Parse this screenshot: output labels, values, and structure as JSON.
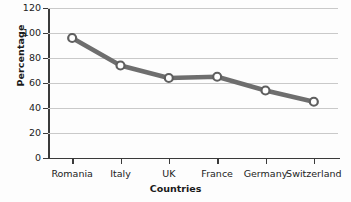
{
  "chart_data": {
    "type": "line",
    "title": "",
    "xlabel": "Countries",
    "ylabel": "Percentage",
    "categories": [
      "Romania",
      "Italy",
      "UK",
      "France",
      "Germany",
      "Switzerland"
    ],
    "values": [
      96,
      74,
      64,
      65,
      54,
      45
    ],
    "series": [
      {
        "name": "Percentage",
        "values": [
          96,
          74,
          64,
          65,
          54,
          45
        ]
      }
    ],
    "ylim": [
      0,
      120
    ],
    "yticks": [
      0,
      20,
      40,
      60,
      80,
      100,
      120
    ],
    "ytick_labels": [
      "0",
      "20",
      "40",
      "60",
      "80",
      "100",
      "120"
    ],
    "grid": "horizontal",
    "legend": "none",
    "marker": "open-circle",
    "colors": {
      "line": "#6e6e6e",
      "marker_fill": "#ffffff",
      "marker_edge": "#5f5f5f",
      "gridline": "#c9c9c9",
      "axis": "#3a3a3a",
      "text": "#222222",
      "background": "#fdfdfd"
    }
  }
}
